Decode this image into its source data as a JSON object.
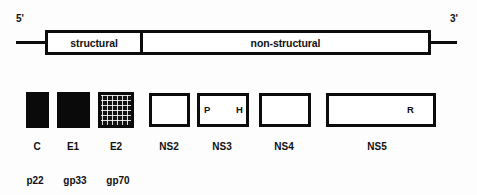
{
  "figure": {
    "background_color": "#fdfdfd",
    "ink_color": "#0c0c0c"
  },
  "genome": {
    "five_prime_label": "5'",
    "three_prime_label": "3'",
    "regions": [
      {
        "id": "structural",
        "label": "structural",
        "x": 45,
        "width": 98
      },
      {
        "id": "non-structural",
        "label": "non-structural",
        "x": 140,
        "width": 291
      }
    ]
  },
  "polyprotein": {
    "products": [
      {
        "id": "c",
        "label": "C",
        "fill": "solid",
        "x": 26,
        "width": 23,
        "center": 37,
        "domains": []
      },
      {
        "id": "e1",
        "label": "E1",
        "fill": "solid",
        "x": 57,
        "width": 33,
        "center": 73,
        "domains": []
      },
      {
        "id": "e2",
        "label": "E2",
        "fill": "hatched",
        "x": 98,
        "width": 36,
        "center": 116,
        "domains": []
      },
      {
        "id": "ns2",
        "label": "NS2",
        "fill": "open",
        "x": 149,
        "width": 41,
        "center": 169,
        "domains": []
      },
      {
        "id": "ns3",
        "label": "NS3",
        "fill": "open",
        "x": 197,
        "width": 52,
        "center": 222,
        "domains": [
          {
            "id": "protease",
            "letter": "P",
            "x": 204
          },
          {
            "id": "helicase",
            "letter": "H",
            "x": 236
          }
        ]
      },
      {
        "id": "ns4",
        "label": "NS4",
        "fill": "open",
        "x": 259,
        "width": 52,
        "center": 284,
        "domains": []
      },
      {
        "id": "ns5",
        "label": "NS5",
        "fill": "open",
        "x": 326,
        "width": 110,
        "center": 377,
        "domains": [
          {
            "id": "rna-polymerase",
            "letter": "R",
            "x": 407
          }
        ]
      }
    ],
    "glycoproteins": [
      {
        "id": "p22",
        "label": "p22",
        "center": 35
      },
      {
        "id": "gp33",
        "label": "gp33",
        "center": 75
      },
      {
        "id": "gp70",
        "label": "gp70",
        "center": 118
      }
    ]
  }
}
